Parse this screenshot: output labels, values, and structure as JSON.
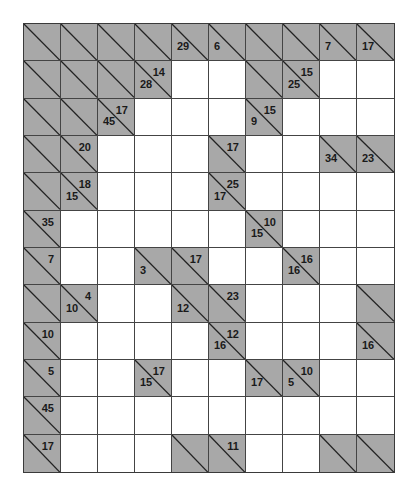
{
  "puzzle": {
    "type": "kakuro",
    "rows": 12,
    "cols": 10,
    "colors": {
      "block": "#a8a8a8",
      "empty": "#ffffff",
      "line": "#444444",
      "text": "#1a1a1a"
    },
    "grid": [
      [
        {
          "t": "X"
        },
        {
          "t": "X"
        },
        {
          "t": "X"
        },
        {
          "t": "X"
        },
        {
          "t": "C",
          "d": "29"
        },
        {
          "t": "C",
          "d": "6"
        },
        {
          "t": "X"
        },
        {
          "t": "X"
        },
        {
          "t": "C",
          "d": "7"
        },
        {
          "t": "C",
          "d": "17"
        }
      ],
      [
        {
          "t": "X"
        },
        {
          "t": "X"
        },
        {
          "t": "X"
        },
        {
          "t": "C",
          "d": "28",
          "r": "14"
        },
        {
          "t": "W"
        },
        {
          "t": "W"
        },
        {
          "t": "X"
        },
        {
          "t": "C",
          "d": "25",
          "r": "15"
        },
        {
          "t": "W"
        },
        {
          "t": "W"
        }
      ],
      [
        {
          "t": "X"
        },
        {
          "t": "X"
        },
        {
          "t": "C",
          "d": "45",
          "r": "17"
        },
        {
          "t": "W"
        },
        {
          "t": "W"
        },
        {
          "t": "W"
        },
        {
          "t": "C",
          "d": "9",
          "r": "15"
        },
        {
          "t": "W"
        },
        {
          "t": "W"
        },
        {
          "t": "W"
        }
      ],
      [
        {
          "t": "X"
        },
        {
          "t": "C",
          "r": "20"
        },
        {
          "t": "W"
        },
        {
          "t": "W"
        },
        {
          "t": "W"
        },
        {
          "t": "C",
          "r": "17"
        },
        {
          "t": "W"
        },
        {
          "t": "W"
        },
        {
          "t": "C",
          "d": "34"
        },
        {
          "t": "C",
          "d": "23"
        }
      ],
      [
        {
          "t": "X"
        },
        {
          "t": "C",
          "d": "15",
          "r": "18"
        },
        {
          "t": "W"
        },
        {
          "t": "W"
        },
        {
          "t": "W"
        },
        {
          "t": "C",
          "d": "17",
          "r": "25"
        },
        {
          "t": "W"
        },
        {
          "t": "W"
        },
        {
          "t": "W"
        },
        {
          "t": "W"
        }
      ],
      [
        {
          "t": "C",
          "r": "35"
        },
        {
          "t": "W"
        },
        {
          "t": "W"
        },
        {
          "t": "W"
        },
        {
          "t": "W"
        },
        {
          "t": "W"
        },
        {
          "t": "C",
          "d": "15",
          "r": "10"
        },
        {
          "t": "W"
        },
        {
          "t": "W"
        },
        {
          "t": "W"
        }
      ],
      [
        {
          "t": "C",
          "r": "7"
        },
        {
          "t": "W"
        },
        {
          "t": "W"
        },
        {
          "t": "C",
          "d": "3"
        },
        {
          "t": "C",
          "r": "17"
        },
        {
          "t": "W"
        },
        {
          "t": "W"
        },
        {
          "t": "C",
          "d": "16",
          "r": "16"
        },
        {
          "t": "W"
        },
        {
          "t": "W"
        }
      ],
      [
        {
          "t": "X"
        },
        {
          "t": "C",
          "d": "10",
          "r": "4"
        },
        {
          "t": "W"
        },
        {
          "t": "W"
        },
        {
          "t": "C",
          "d": "12"
        },
        {
          "t": "C",
          "r": "23"
        },
        {
          "t": "W"
        },
        {
          "t": "W"
        },
        {
          "t": "W"
        },
        {
          "t": "X"
        }
      ],
      [
        {
          "t": "C",
          "r": "10"
        },
        {
          "t": "W"
        },
        {
          "t": "W"
        },
        {
          "t": "W"
        },
        {
          "t": "W"
        },
        {
          "t": "C",
          "d": "16",
          "r": "12"
        },
        {
          "t": "W"
        },
        {
          "t": "W"
        },
        {
          "t": "W"
        },
        {
          "t": "C",
          "d": "16"
        }
      ],
      [
        {
          "t": "C",
          "r": "5"
        },
        {
          "t": "W"
        },
        {
          "t": "W"
        },
        {
          "t": "C",
          "d": "15",
          "r": "17"
        },
        {
          "t": "W"
        },
        {
          "t": "W"
        },
        {
          "t": "C",
          "d": "17"
        },
        {
          "t": "C",
          "d": "5",
          "r": "10"
        },
        {
          "t": "W"
        },
        {
          "t": "W"
        }
      ],
      [
        {
          "t": "C",
          "r": "45"
        },
        {
          "t": "W"
        },
        {
          "t": "W"
        },
        {
          "t": "W"
        },
        {
          "t": "W"
        },
        {
          "t": "W"
        },
        {
          "t": "W"
        },
        {
          "t": "W"
        },
        {
          "t": "W"
        },
        {
          "t": "W"
        }
      ],
      [
        {
          "t": "C",
          "r": "17"
        },
        {
          "t": "W"
        },
        {
          "t": "W"
        },
        {
          "t": "W"
        },
        {
          "t": "X"
        },
        {
          "t": "C",
          "r": "11"
        },
        {
          "t": "W"
        },
        {
          "t": "W"
        },
        {
          "t": "X"
        },
        {
          "t": "X"
        }
      ]
    ]
  }
}
